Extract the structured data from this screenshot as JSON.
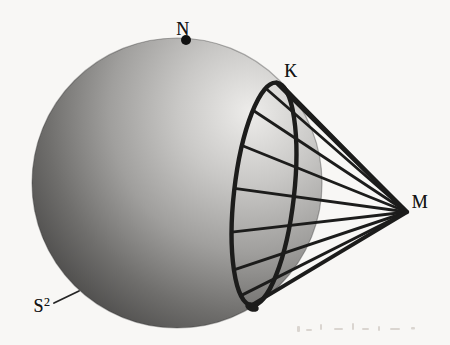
{
  "figure": {
    "background_color": "#f8f7f5",
    "ink_color": "#1c1c1b",
    "labels": {
      "north_pole": {
        "text": "N",
        "x": 183,
        "y": 29
      },
      "tangency_point": {
        "text": "K",
        "x": 291,
        "y": 71
      },
      "external_point": {
        "text": "M",
        "x": 420,
        "y": 202
      },
      "sphere": {
        "base": "S",
        "sup": "2",
        "x": 42,
        "y": 305
      }
    },
    "sphere": {
      "cx": 177,
      "cy": 183,
      "r": 145,
      "rim_color": "rgba(40,40,40,0.35)",
      "gradient": {
        "fx": 250,
        "fy": 112,
        "radius": 255,
        "stops": [
          {
            "offset": "0%",
            "color": "#edecea"
          },
          {
            "offset": "28%",
            "color": "#c9c8c6"
          },
          {
            "offset": "55%",
            "color": "#a09f9d"
          },
          {
            "offset": "80%",
            "color": "#6f6e6c"
          },
          {
            "offset": "100%",
            "color": "#4c4b4a"
          }
        ]
      }
    },
    "north_dot": {
      "x": 186,
      "y": 40,
      "r": 5
    },
    "tangent_circle": {
      "cx": 264,
      "cy": 194,
      "rx": 30,
      "ry": 112,
      "rotation_deg": 6.5,
      "stroke_width": 4.4
    },
    "apex": {
      "x": 407,
      "y": 212
    },
    "fan_lines": [
      {
        "t": -0.25,
        "w": 3.4
      },
      {
        "t": 0.0,
        "w": 4.4
      },
      {
        "t": 0.35,
        "w": 2.8
      },
      {
        "t": 0.75,
        "w": 2.8
      },
      {
        "t": 1.15,
        "w": 2.8
      },
      {
        "t": 1.55,
        "w": 2.8
      },
      {
        "t": 1.95,
        "w": 2.8
      },
      {
        "t": 2.35,
        "w": 2.9
      },
      {
        "t": 2.75,
        "w": 3.0
      },
      {
        "t": 3.1416,
        "w": 3.8
      }
    ],
    "bottom_junction_blob": {
      "cx": 252,
      "cy": 307,
      "rx": 7,
      "ry": 4.5,
      "rotation_deg": 20
    },
    "leader_line": {
      "x1": 54,
      "y1": 303,
      "x2": 79,
      "y2": 291,
      "w": 1.8
    },
    "scan_artifacts": {
      "color": "#a89f93",
      "opacity": 0.38,
      "marks": [
        {
          "x": 297,
          "y": 326,
          "w": 3,
          "h": 6
        },
        {
          "x": 306,
          "y": 329,
          "w": 6,
          "h": 2
        },
        {
          "x": 320,
          "y": 324,
          "w": 2,
          "h": 6
        },
        {
          "x": 334,
          "y": 328,
          "w": 9,
          "h": 2
        },
        {
          "x": 352,
          "y": 323,
          "w": 2,
          "h": 7
        },
        {
          "x": 362,
          "y": 328,
          "w": 7,
          "h": 2
        },
        {
          "x": 378,
          "y": 326,
          "w": 2,
          "h": 5
        },
        {
          "x": 390,
          "y": 328,
          "w": 10,
          "h": 2
        },
        {
          "x": 411,
          "y": 327,
          "w": 4,
          "h": 2.5
        }
      ]
    }
  }
}
